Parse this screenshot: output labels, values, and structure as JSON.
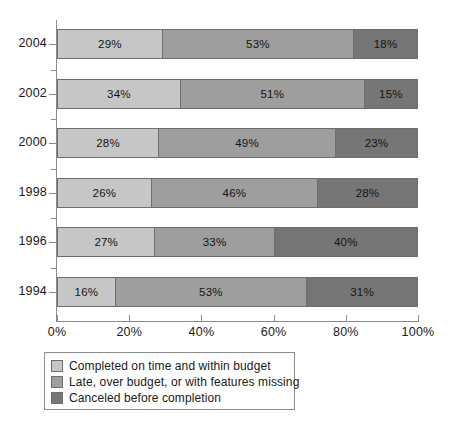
{
  "chart_data": {
    "type": "bar",
    "orientation": "horizontal",
    "stacked": true,
    "normalized_percent": true,
    "title": "",
    "subtitle": "",
    "xlabel": "",
    "ylabel": "",
    "xlim": [
      0,
      100
    ],
    "grid": false,
    "legend_position": "bottom-left",
    "categories": [
      "2004",
      "2002",
      "2000",
      "1998",
      "1996",
      "1994"
    ],
    "x_tick_labels": [
      "0%",
      "20%",
      "40%",
      "60%",
      "80%",
      "100%"
    ],
    "x_tick_values": [
      0,
      20,
      40,
      60,
      80,
      100
    ],
    "series": [
      {
        "name": "Completed on time and within budget",
        "color": "#c6c6c6",
        "values": [
          29,
          34,
          28,
          26,
          27,
          16
        ],
        "value_labels": [
          "29%",
          "34%",
          "28%",
          "26%",
          "27%",
          "16%"
        ]
      },
      {
        "name": "Late, over budget, or with features missing",
        "color": "#9e9e9e",
        "values": [
          53,
          51,
          49,
          46,
          33,
          53
        ],
        "value_labels": [
          "53%",
          "51%",
          "49%",
          "46%",
          "33%",
          "53%"
        ]
      },
      {
        "name": "Canceled before completion",
        "color": "#767676",
        "values": [
          18,
          15,
          23,
          28,
          40,
          31
        ],
        "value_labels": [
          "18%",
          "15%",
          "23%",
          "28%",
          "40%",
          "31%"
        ]
      }
    ]
  },
  "legend": {
    "items": [
      {
        "label": "Completed on time and within budget",
        "color": "#c6c6c6"
      },
      {
        "label": "Late, over budget, or with features missing",
        "color": "#9e9e9e"
      },
      {
        "label": "Canceled before completion",
        "color": "#767676"
      }
    ]
  },
  "axis": {
    "tick_color": "#8a8a8a",
    "segment_border_color": "#6e6e6e"
  }
}
